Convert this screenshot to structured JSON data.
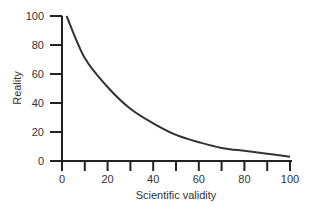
{
  "chart_data": {
    "type": "line",
    "title": "",
    "xlabel": "Scientific validity",
    "ylabel": "Reality",
    "xlim": [
      0,
      100
    ],
    "ylim": [
      0,
      100
    ],
    "x_ticks": [
      0,
      20,
      40,
      60,
      80,
      100
    ],
    "x_minor_ticks": [
      10,
      30,
      50,
      70,
      90
    ],
    "y_ticks": [
      0,
      20,
      40,
      60,
      80,
      100
    ],
    "grid": false,
    "legend": null,
    "series": [
      {
        "name": "Reality vs Scientific validity",
        "x": [
          2,
          10,
          20,
          30,
          40,
          50,
          60,
          70,
          80,
          90,
          100
        ],
        "y": [
          100,
          71,
          51,
          36,
          26,
          18,
          13,
          9,
          7,
          5,
          3
        ]
      }
    ],
    "colors": {
      "line": "#333333",
      "axis": "#222222"
    }
  }
}
